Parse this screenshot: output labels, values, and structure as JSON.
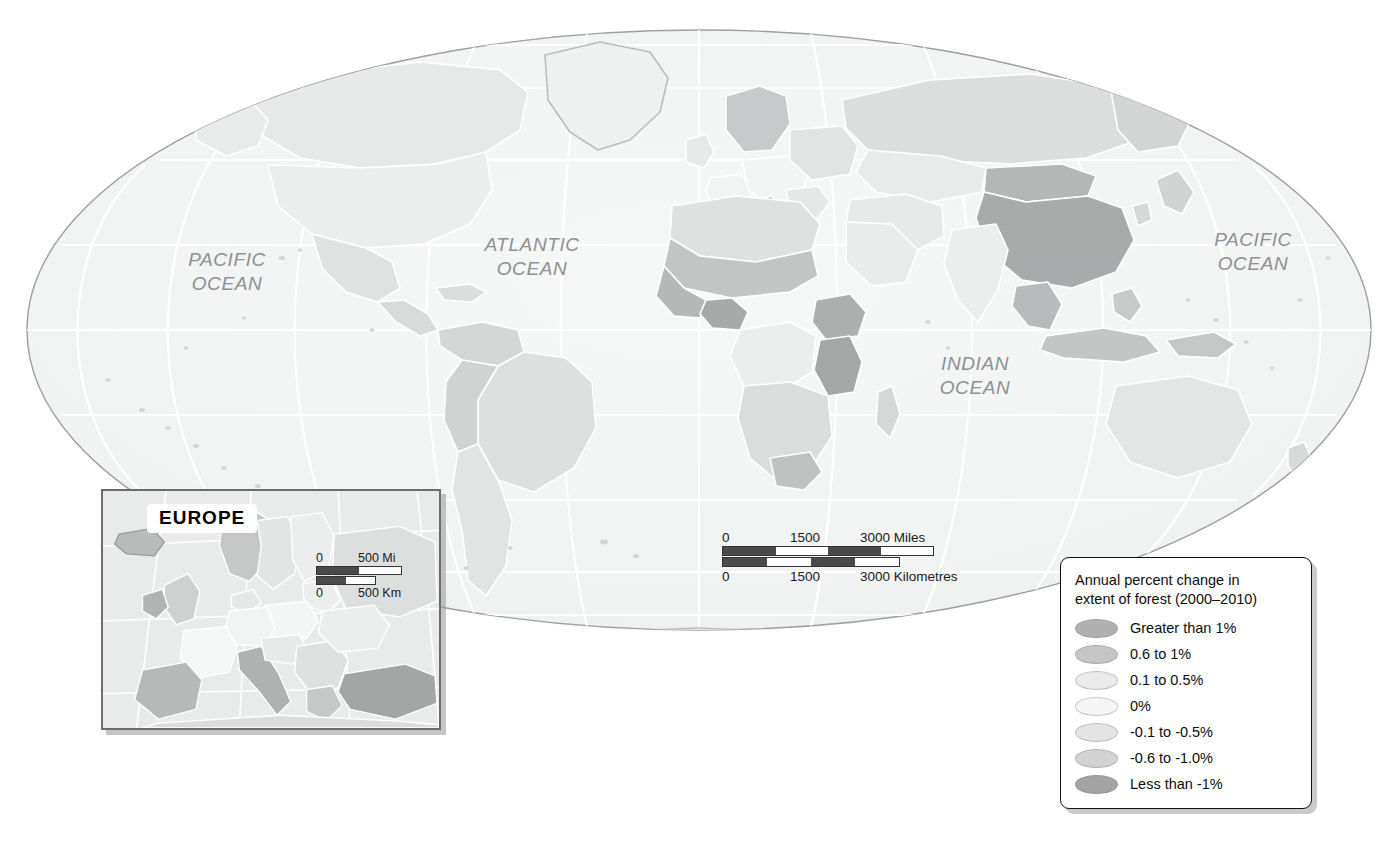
{
  "map": {
    "projection": "mollweide",
    "ocean_labels": [
      {
        "name": "pacific-west",
        "text": "PACIFIC\nOCEAN"
      },
      {
        "name": "atlantic",
        "text": "ATLANTIC\nOCEAN"
      },
      {
        "name": "indian",
        "text": "INDIAN\nOCEAN"
      },
      {
        "name": "pacific-east",
        "text": "PACIFIC\nOCEAN"
      }
    ],
    "colors": {
      "ocean": "#f2f3f3",
      "graticule": "#ffffff",
      "outline": "#9aa0a4",
      "land_border": "#ffffff"
    }
  },
  "scalebar_main": {
    "miles": {
      "start": "0",
      "mid": "1500",
      "end": "3000 Miles"
    },
    "km": {
      "start": "0",
      "mid": "1500",
      "end": "3000 Kilometres"
    }
  },
  "europe_inset": {
    "title": "EUROPE",
    "scalebar": {
      "miles": {
        "start": "0",
        "end": "500 Mi"
      },
      "km": {
        "start": "0",
        "end": "500 Km"
      }
    }
  },
  "legend": {
    "title": "Annual percent change in\nextent of forest (2000–2010)",
    "items": [
      {
        "label": "Greater than 1%",
        "color": "#b0b0b0"
      },
      {
        "label": "0.6 to 1%",
        "color": "#c6c6c6"
      },
      {
        "label": "0.1 to 0.5%",
        "color": "#eaeaea"
      },
      {
        "label": "0%",
        "color": "#f5f5f5"
      },
      {
        "label": "-0.1 to -0.5%",
        "color": "#e4e4e4"
      },
      {
        "label": "-0.6 to -1.0%",
        "color": "#d2d2d2"
      },
      {
        "label": "Less than -1%",
        "color": "#a3a3a3"
      }
    ]
  },
  "chart_data": {
    "type": "map",
    "title": "Annual percent change in extent of forest (2000–2010)",
    "variable": "Annual percent change in extent of forest",
    "period": "2000–2010",
    "units": "percent per year",
    "classes": [
      {
        "label": "Greater than 1%",
        "min": 1.0,
        "max": null,
        "color": "#b0b0b0"
      },
      {
        "label": "0.6 to 1%",
        "min": 0.6,
        "max": 1.0,
        "color": "#c6c6c6"
      },
      {
        "label": "0.1 to 0.5%",
        "min": 0.1,
        "max": 0.5,
        "color": "#eaeaea"
      },
      {
        "label": "0%",
        "min": 0.0,
        "max": 0.0,
        "color": "#f5f5f5"
      },
      {
        "label": "-0.1 to -0.5%",
        "min": -0.5,
        "max": -0.1,
        "color": "#e4e4e4"
      },
      {
        "label": "-0.6 to -1.0%",
        "min": -1.0,
        "max": -0.6,
        "color": "#d2d2d2"
      },
      {
        "label": "Less than -1%",
        "min": null,
        "max": -1.0,
        "color": "#a3a3a3"
      }
    ],
    "legend_position": "bottom-right",
    "grid": true,
    "insets": [
      "EUROPE"
    ],
    "scalebars": [
      "0 1500 3000 Miles",
      "0 1500 3000 Kilometres",
      "0 500 Mi",
      "0 500 Km"
    ]
  }
}
